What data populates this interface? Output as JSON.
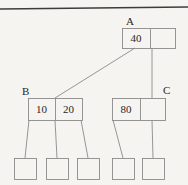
{
  "diagram": {
    "kind": "b-tree",
    "title_visible": false,
    "background_color": "#f6f4f1",
    "stroke_color": "#8a8a8a",
    "text_color": "#262626",
    "rule_color": "#3c3c3c",
    "top_rule": {
      "name": "top-horizontal-rule",
      "x1": 0,
      "y1": 9,
      "x2": 188,
      "y2": 7
    },
    "nodes": [
      {
        "id": "A",
        "label": "A",
        "label_x": 126,
        "label_y": 16,
        "box": {
          "x": 122,
          "y": 28,
          "w": 53,
          "h": 20
        },
        "dividers": [
          28
        ],
        "cells": [
          {
            "value": "40",
            "x": 122,
            "w": 28
          },
          {
            "value": "",
            "x": 150,
            "w": 25
          }
        ]
      },
      {
        "id": "B",
        "label": "B",
        "label_x": 22,
        "label_y": 86,
        "box": {
          "x": 28,
          "y": 98,
          "w": 54,
          "h": 22
        },
        "dividers": [
          27
        ],
        "cells": [
          {
            "value": "10",
            "x": 28,
            "w": 27
          },
          {
            "value": "20",
            "x": 55,
            "w": 27
          }
        ]
      },
      {
        "id": "C",
        "label": "C",
        "label_x": 163,
        "label_y": 85,
        "box": {
          "x": 112,
          "y": 98,
          "w": 53,
          "h": 22
        },
        "dividers": [
          28
        ],
        "cells": [
          {
            "value": "80",
            "x": 112,
            "w": 28
          },
          {
            "value": "",
            "x": 140,
            "w": 25
          }
        ]
      }
    ],
    "leaves": [
      {
        "id": "L1",
        "x": 14,
        "y": 158,
        "w": 22,
        "h": 21
      },
      {
        "id": "L2",
        "x": 46,
        "y": 158,
        "w": 22,
        "h": 21
      },
      {
        "id": "L3",
        "x": 77,
        "y": 158,
        "w": 22,
        "h": 21
      },
      {
        "id": "L4",
        "x": 112,
        "y": 158,
        "w": 22,
        "h": 21
      },
      {
        "id": "L5",
        "x": 142,
        "y": 158,
        "w": 22,
        "h": 21
      }
    ],
    "edges": [
      {
        "from": "A",
        "to": "B",
        "x1": 135,
        "y1": 48,
        "x2": 55,
        "y2": 98
      },
      {
        "from": "A",
        "to": "C",
        "x1": 152,
        "y1": 48,
        "x2": 152,
        "y2": 98
      },
      {
        "from": "B",
        "to": "L1",
        "x1": 29,
        "y1": 120,
        "x2": 25,
        "y2": 158
      },
      {
        "from": "B",
        "to": "L2",
        "x1": 55,
        "y1": 120,
        "x2": 57,
        "y2": 158
      },
      {
        "from": "B",
        "to": "L3",
        "x1": 81,
        "y1": 120,
        "x2": 88,
        "y2": 158
      },
      {
        "from": "C",
        "to": "L4",
        "x1": 113,
        "y1": 120,
        "x2": 123,
        "y2": 158
      },
      {
        "from": "C",
        "to": "L5",
        "x1": 152,
        "y1": 120,
        "x2": 153,
        "y2": 158
      }
    ]
  }
}
